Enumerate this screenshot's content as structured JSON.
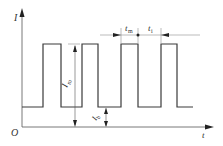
{
  "diagram": {
    "type": "pulsed-current-waveform",
    "colors": {
      "line": "#3a3a3a",
      "axis": "#555555",
      "background": "#ffffff"
    },
    "axes": {
      "origin_label": "O",
      "y_label": "I",
      "x_label": "t"
    },
    "labels": {
      "peak_current": {
        "main": "I",
        "sub": "m"
      },
      "base_current": {
        "main": "I",
        "sub": "b"
      },
      "pulse_time": {
        "main": "t",
        "sub": "m"
      },
      "interval_time": {
        "main": "t",
        "sub": "i"
      }
    },
    "pulses": [
      {
        "rise_x": 43,
        "fall_x": 61
      },
      {
        "rise_x": 82,
        "fall_x": 98
      },
      {
        "rise_x": 121,
        "fall_x": 138
      },
      {
        "rise_x": 161,
        "fall_x": 177
      }
    ],
    "levels": {
      "high_y": 44,
      "low_y": 107,
      "axis_y": 127
    }
  }
}
